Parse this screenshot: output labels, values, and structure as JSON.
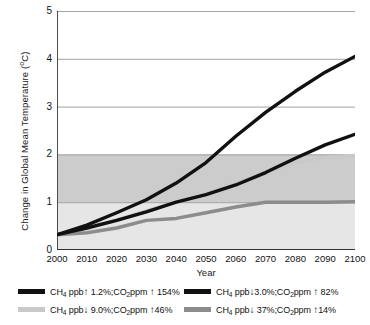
{
  "chart_data": {
    "type": "line",
    "title": "",
    "xlabel": "Year",
    "ylabel": "Change in Global Mean Temperature (°C)",
    "ylabel_main": "Change in Global Mean Temperature (",
    "ylabel_unit": "o",
    "ylabel_tail": "C)",
    "xlim": [
      2000,
      2100
    ],
    "ylim": [
      0,
      5
    ],
    "grid": true,
    "legend_position": "bottom",
    "xticks": [
      2000,
      2010,
      2020,
      2030,
      2040,
      2050,
      2060,
      2070,
      2080,
      2090,
      2100
    ],
    "yticks": [
      0,
      1,
      2,
      3,
      4,
      5
    ],
    "x": [
      2000,
      2010,
      2020,
      2030,
      2040,
      2050,
      2060,
      2070,
      2080,
      2090,
      2100
    ],
    "shaded_bands": [
      {
        "name": "band-0-to-1",
        "from": 0,
        "to": 1,
        "color": "#e6e6e6"
      },
      {
        "name": "band-1-to-2",
        "from": 1,
        "to": 2,
        "color": "#cccccc"
      }
    ],
    "series": [
      {
        "name": "series-1",
        "color": "#111111",
        "values": [
          0.32,
          0.52,
          0.78,
          1.05,
          1.4,
          1.83,
          2.38,
          2.88,
          3.32,
          3.72,
          4.05
        ],
        "label_prefix": "CH",
        "label_sub1": "4",
        "label_mid": " ppb",
        "arrow1": "↑",
        "label_a": " 1.2%;CO",
        "label_sub2": "2",
        "label_b": "ppm ",
        "arrow2": "↑",
        "label_c": " 154%"
      },
      {
        "name": "series-2",
        "color": "#111111",
        "values": [
          0.32,
          0.46,
          0.62,
          0.8,
          1.0,
          1.16,
          1.36,
          1.62,
          1.92,
          2.2,
          2.42
        ],
        "label_prefix": "CH",
        "label_sub1": "4",
        "label_mid": " ppb",
        "arrow1": "↓",
        "label_a": "3.0%;CO",
        "label_sub2": "2",
        "label_b": "ppm ",
        "arrow2": "↑",
        "label_c": " 82%"
      },
      {
        "name": "series-3",
        "color": "#c9c9c9",
        "values": [
          0.32,
          0.45,
          0.62,
          0.82,
          1.0,
          1.17,
          1.4,
          1.62,
          1.82,
          1.94,
          1.98
        ],
        "label_prefix": "CH",
        "label_sub1": "4",
        "label_mid": " ppb",
        "arrow1": "↓",
        "label_a": " 9.0%;CO",
        "label_sub2": "2",
        "label_b": "ppm ",
        "arrow2": "↑",
        "label_c": "46%"
      },
      {
        "name": "series-4",
        "color": "#8c8c8c",
        "values": [
          0.32,
          0.36,
          0.46,
          0.62,
          0.66,
          0.78,
          0.9,
          1.0,
          1.0,
          1.0,
          1.01
        ],
        "label_prefix": "CH",
        "label_sub1": "4",
        "label_mid": " ppb",
        "arrow1": "↓",
        "label_a": " 37%;CO",
        "label_sub2": "2",
        "label_b": "ppm ",
        "arrow2": "↑",
        "label_c": "14%"
      }
    ]
  },
  "axis": {
    "y_tick_labels": [
      "5",
      "4",
      "3",
      "2",
      "1",
      "0"
    ],
    "x_tick_labels": [
      "2000",
      "2010",
      "2020",
      "2030",
      "2040",
      "2050",
      "2060",
      "2070",
      "2080",
      "2090",
      "2100"
    ],
    "x_title": "Year"
  }
}
